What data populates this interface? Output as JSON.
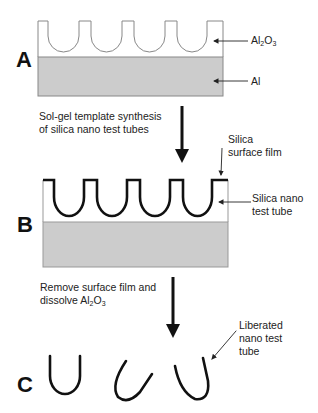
{
  "panels": {
    "a": {
      "letter": "A",
      "labels": {
        "top_pre": "Al",
        "top_sub1": "2",
        "top_mid": "O",
        "top_sub2": "3",
        "bottom": "Al"
      }
    },
    "b": {
      "letter": "B",
      "labels": {
        "film_line1": "Silica",
        "film_line2": "surface film",
        "tube_line1": "Silica nano",
        "tube_line2": "test tube"
      }
    },
    "c": {
      "letter": "C",
      "labels": {
        "line1": "Liberated",
        "line2": "nano test",
        "line3": "tube"
      }
    }
  },
  "steps": {
    "step1": {
      "line1": "Sol-gel template synthesis",
      "line2": "of silica nano test tubes"
    },
    "step2": {
      "line1": "Remove surface film and",
      "line2_pre": "dissolve Al",
      "line2_sub1": "2",
      "line2_mid": "O",
      "line2_sub2": "3"
    }
  },
  "colors": {
    "substrate": "#cccccc",
    "outline": "#888888",
    "silica": "#111111"
  }
}
